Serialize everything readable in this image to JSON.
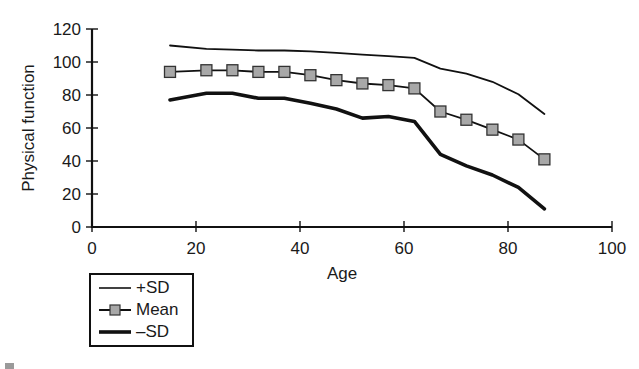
{
  "chart_data": {
    "type": "line",
    "title": "",
    "xlabel": "Age",
    "ylabel": "Physical function",
    "xlim": [
      0,
      100
    ],
    "ylim": [
      0,
      120
    ],
    "xticks": [
      0,
      20,
      40,
      60,
      80,
      100
    ],
    "yticks": [
      0,
      20,
      40,
      60,
      80,
      100,
      120
    ],
    "grid": false,
    "legend_position": "bottom-left (below x-axis)",
    "x": [
      15,
      22,
      27,
      32,
      37,
      42,
      47,
      52,
      57,
      62,
      67,
      72,
      77,
      82,
      87
    ],
    "series": [
      {
        "name": "+SD",
        "style": "thin line",
        "values": [
          110,
          108,
          107.5,
          107,
          107,
          106.5,
          105.5,
          104.5,
          103.5,
          102.5,
          96,
          93,
          88,
          80.5,
          68.5
        ]
      },
      {
        "name": "Mean",
        "style": "line with square markers",
        "values": [
          94,
          95,
          95,
          94,
          94,
          92,
          89,
          87,
          86,
          84,
          70,
          65,
          59,
          53,
          41
        ]
      },
      {
        "name": "–SD",
        "style": "thick line",
        "values": [
          77,
          81,
          81,
          78,
          78,
          75,
          71.5,
          66,
          67,
          64,
          44,
          37,
          31.5,
          24,
          11
        ]
      }
    ]
  },
  "axes": {
    "x_ticks": [
      "0",
      "20",
      "40",
      "60",
      "80",
      "100"
    ],
    "y_ticks": [
      "0",
      "20",
      "40",
      "60",
      "80",
      "100",
      "120"
    ],
    "xlabel": "Age",
    "ylabel": "Physical function"
  },
  "legend": {
    "items": [
      {
        "label": "+SD"
      },
      {
        "label": "Mean"
      },
      {
        "label": "–SD"
      }
    ]
  },
  "colors": {
    "line": "#111111",
    "marker_fill": "#a8a8a8",
    "marker_stroke": "#333333"
  }
}
